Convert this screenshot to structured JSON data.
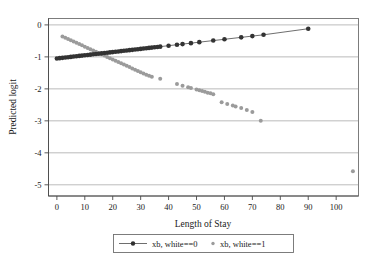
{
  "chart_data": {
    "type": "scatter",
    "title": "",
    "xlabel": "Length of Stay",
    "ylabel": "Predicted logit",
    "xlim": [
      -3,
      108
    ],
    "ylim": [
      -5.35,
      0.2
    ],
    "xticks": [
      0,
      10,
      20,
      30,
      40,
      50,
      60,
      70,
      80,
      90,
      100
    ],
    "yticks": [
      0,
      -1,
      -2,
      -3,
      -4,
      -5
    ],
    "xtick_labels": [
      "0",
      "10",
      "20",
      "30",
      "40",
      "50",
      "60",
      "70",
      "80",
      "90",
      "100"
    ],
    "ytick_labels": [
      "0",
      "-1",
      "-2",
      "-3",
      "-4",
      "-5"
    ],
    "grid": true,
    "grid_axis": "y",
    "legend_position": "below-center",
    "colors": {
      "series_white_0": "#333333",
      "series_white_1": "#9b9b9b",
      "grid": "#8d8d8d",
      "frame": "#6f6f6f",
      "background": "#ffffff"
    },
    "series": [
      {
        "name": "xb, white==0",
        "marker": "filled-circle",
        "has_line": true,
        "color": "#333333",
        "points": [
          [
            0,
            -1.05
          ],
          [
            1,
            -1.04
          ],
          [
            2,
            -1.03
          ],
          [
            3,
            -1.02
          ],
          [
            4,
            -1.01
          ],
          [
            5,
            -1.0
          ],
          [
            6,
            -0.99
          ],
          [
            7,
            -0.98
          ],
          [
            8,
            -0.97
          ],
          [
            9,
            -0.96
          ],
          [
            10,
            -0.95
          ],
          [
            11,
            -0.94
          ],
          [
            12,
            -0.93
          ],
          [
            13,
            -0.92
          ],
          [
            14,
            -0.91
          ],
          [
            15,
            -0.9
          ],
          [
            16,
            -0.89
          ],
          [
            17,
            -0.88
          ],
          [
            18,
            -0.87
          ],
          [
            19,
            -0.86
          ],
          [
            20,
            -0.85
          ],
          [
            21,
            -0.84
          ],
          [
            22,
            -0.83
          ],
          [
            23,
            -0.82
          ],
          [
            24,
            -0.81
          ],
          [
            25,
            -0.8
          ],
          [
            26,
            -0.79
          ],
          [
            27,
            -0.78
          ],
          [
            28,
            -0.77
          ],
          [
            29,
            -0.76
          ],
          [
            30,
            -0.75
          ],
          [
            31,
            -0.74
          ],
          [
            32,
            -0.73
          ],
          [
            33,
            -0.72
          ],
          [
            34,
            -0.71
          ],
          [
            35,
            -0.7
          ],
          [
            36,
            -0.69
          ],
          [
            37,
            -0.68
          ],
          [
            40,
            -0.65
          ],
          [
            43,
            -0.62
          ],
          [
            45,
            -0.6
          ],
          [
            48,
            -0.57
          ],
          [
            51,
            -0.54
          ],
          [
            56,
            -0.49
          ],
          [
            60,
            -0.45
          ],
          [
            66,
            -0.39
          ],
          [
            70,
            -0.35
          ],
          [
            74,
            -0.31
          ],
          [
            90,
            -0.12
          ]
        ]
      },
      {
        "name": "xb, white==1",
        "marker": "small-circle",
        "has_line": false,
        "color": "#9b9b9b",
        "points": [
          [
            2,
            -0.36
          ],
          [
            3,
            -0.4
          ],
          [
            4,
            -0.44
          ],
          [
            5,
            -0.48
          ],
          [
            6,
            -0.52
          ],
          [
            7,
            -0.56
          ],
          [
            8,
            -0.6
          ],
          [
            9,
            -0.64
          ],
          [
            10,
            -0.68
          ],
          [
            11,
            -0.72
          ],
          [
            12,
            -0.76
          ],
          [
            13,
            -0.8
          ],
          [
            14,
            -0.84
          ],
          [
            15,
            -0.88
          ],
          [
            16,
            -0.92
          ],
          [
            17,
            -0.96
          ],
          [
            18,
            -1.0
          ],
          [
            19,
            -1.04
          ],
          [
            20,
            -1.08
          ],
          [
            21,
            -1.12
          ],
          [
            22,
            -1.16
          ],
          [
            23,
            -1.2
          ],
          [
            24,
            -1.24
          ],
          [
            25,
            -1.28
          ],
          [
            26,
            -1.32
          ],
          [
            27,
            -1.36
          ],
          [
            28,
            -1.4
          ],
          [
            29,
            -1.44
          ],
          [
            30,
            -1.48
          ],
          [
            31,
            -1.52
          ],
          [
            32,
            -1.56
          ],
          [
            33,
            -1.59
          ],
          [
            34,
            -1.62
          ],
          [
            37,
            -1.68
          ],
          [
            43,
            -1.85
          ],
          [
            45,
            -1.9
          ],
          [
            47,
            -1.95
          ],
          [
            48,
            -1.97
          ],
          [
            50,
            -2.02
          ],
          [
            51,
            -2.04
          ],
          [
            52,
            -2.07
          ],
          [
            53,
            -2.09
          ],
          [
            54,
            -2.12
          ],
          [
            55,
            -2.14
          ],
          [
            56,
            -2.17
          ],
          [
            59,
            -2.42
          ],
          [
            61,
            -2.47
          ],
          [
            63,
            -2.52
          ],
          [
            64,
            -2.55
          ],
          [
            66,
            -2.6
          ],
          [
            68,
            -2.66
          ],
          [
            70,
            -2.72
          ],
          [
            73,
            -3.0
          ],
          [
            106,
            -4.58
          ]
        ]
      }
    ]
  },
  "legend": {
    "entries": [
      {
        "label": "xb, white==0",
        "style": "line-marker"
      },
      {
        "label": "xb, white==1",
        "style": "marker-only"
      }
    ]
  }
}
